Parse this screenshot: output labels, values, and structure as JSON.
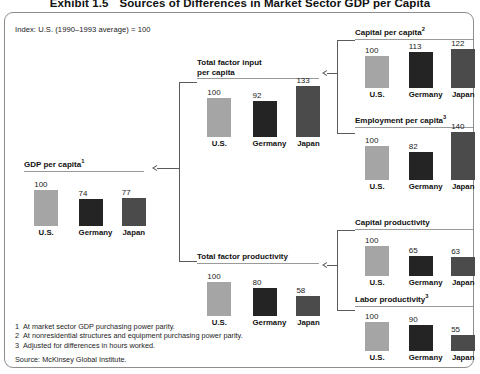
{
  "exhibit": {
    "number": "Exhibit 1.5",
    "title": "Sources of Differences in Market Sector GDP per Capita"
  },
  "index_note": "Index: U.S. (1990–1993 average) = 100",
  "categories": [
    "U.S.",
    "Germany",
    "Japan"
  ],
  "colors": {
    "us_bar": "#a5a5a5",
    "germany_bar": "#242424",
    "japan_bar": "#4b4b4b",
    "rule": "#9a9a9a",
    "connector": "#5b5b5b",
    "frame": "#8d8d8d"
  },
  "charts": {
    "gdp_per_capita": {
      "title": "GDP per capita",
      "footnote_marker": "1",
      "values": [
        100,
        74,
        77
      ]
    },
    "total_factor_input": {
      "title_line1": "Total factor input",
      "title_line2": "per capita",
      "footnote_marker": "",
      "values": [
        100,
        92,
        133
      ]
    },
    "total_factor_productivity": {
      "title": "Total factor productivity",
      "footnote_marker": "",
      "values": [
        100,
        80,
        58
      ]
    },
    "capital_per_capita": {
      "title": "Capital per capita",
      "footnote_marker": "2",
      "values": [
        100,
        113,
        122
      ]
    },
    "employment_per_capita": {
      "title": "Employment per capita",
      "footnote_marker": "3",
      "values": [
        100,
        82,
        140
      ]
    },
    "capital_productivity": {
      "title": "Capital productivity",
      "footnote_marker": "",
      "values": [
        100,
        65,
        63
      ]
    },
    "labor_productivity": {
      "title": "Labor productivity",
      "footnote_marker": "3",
      "values": [
        100,
        90,
        55
      ]
    }
  },
  "footnotes": [
    {
      "num": "1",
      "text": "At market sector GDP purchasing power parity."
    },
    {
      "num": "2",
      "text": "At nonresidential structures and equipment purchasing power parity."
    },
    {
      "num": "3",
      "text": "Adjusted for differences in hours worked."
    }
  ],
  "source": "Source: McKinsey Global Institute.",
  "chart_data": [
    {
      "type": "bar",
      "title": "GDP per capita",
      "categories": [
        "U.S.",
        "Germany",
        "Japan"
      ],
      "values": [
        100,
        74,
        77
      ],
      "xlabel": "",
      "ylabel": "Index (U.S. 1990–1993 average = 100)",
      "ylim": [
        0,
        145
      ],
      "grid": false,
      "legend": "none"
    },
    {
      "type": "bar",
      "title": "Total factor input per capita",
      "categories": [
        "U.S.",
        "Germany",
        "Japan"
      ],
      "values": [
        100,
        92,
        133
      ],
      "xlabel": "",
      "ylabel": "Index (U.S. 1990–1993 average = 100)",
      "ylim": [
        0,
        145
      ],
      "grid": false,
      "legend": "none"
    },
    {
      "type": "bar",
      "title": "Total factor productivity",
      "categories": [
        "U.S.",
        "Germany",
        "Japan"
      ],
      "values": [
        100,
        80,
        58
      ],
      "xlabel": "",
      "ylabel": "Index (U.S. 1990–1993 average = 100)",
      "ylim": [
        0,
        145
      ],
      "grid": false,
      "legend": "none"
    },
    {
      "type": "bar",
      "title": "Capital per capita",
      "categories": [
        "U.S.",
        "Germany",
        "Japan"
      ],
      "values": [
        100,
        113,
        122
      ],
      "xlabel": "",
      "ylabel": "Index (U.S. 1990–1993 average = 100)",
      "ylim": [
        0,
        145
      ],
      "grid": false,
      "legend": "none"
    },
    {
      "type": "bar",
      "title": "Employment per capita",
      "categories": [
        "U.S.",
        "Germany",
        "Japan"
      ],
      "values": [
        100,
        82,
        140
      ],
      "xlabel": "",
      "ylabel": "Index (U.S. 1990–1993 average = 100)",
      "ylim": [
        0,
        145
      ],
      "grid": false,
      "legend": "none"
    },
    {
      "type": "bar",
      "title": "Capital productivity",
      "categories": [
        "U.S.",
        "Germany",
        "Japan"
      ],
      "values": [
        100,
        65,
        63
      ],
      "xlabel": "",
      "ylabel": "Index (U.S. 1990–1993 average = 100)",
      "ylim": [
        0,
        145
      ],
      "grid": false,
      "legend": "none"
    },
    {
      "type": "bar",
      "title": "Labor productivity",
      "categories": [
        "U.S.",
        "Germany",
        "Japan"
      ],
      "values": [
        100,
        90,
        55
      ],
      "xlabel": "",
      "ylabel": "Index (U.S. 1990–1993 average = 100)",
      "ylim": [
        0,
        145
      ],
      "grid": false,
      "legend": "none"
    }
  ]
}
